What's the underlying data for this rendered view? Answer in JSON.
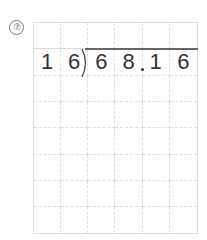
{
  "problem": {
    "number_label": "⑦",
    "number": 7
  },
  "grid": {
    "columns": 6,
    "rows": 8,
    "cells": [
      [
        "",
        "",
        "",
        "",
        "",
        ""
      ],
      [
        "1",
        "6",
        "6",
        "8",
        "1",
        "6"
      ],
      [
        "",
        "",
        "",
        "",
        "",
        ""
      ],
      [
        "",
        "",
        "",
        "",
        "",
        ""
      ],
      [
        "",
        "",
        "",
        "",
        "",
        ""
      ],
      [
        "",
        "",
        "",
        "",
        "",
        ""
      ],
      [
        "",
        "",
        "",
        "",
        "",
        ""
      ],
      [
        "",
        "",
        "",
        "",
        "",
        ""
      ]
    ]
  },
  "division": {
    "divisor": "16",
    "dividend": "68.16",
    "decimal_after_column": 3
  },
  "colors": {
    "grid_line": "#dedede",
    "digit": "#333333",
    "division_bar": "#666666"
  }
}
